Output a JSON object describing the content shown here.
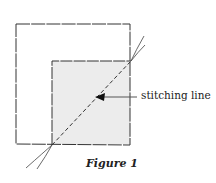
{
  "figure": {
    "caption": "Figure 1",
    "annotations": [
      {
        "label": "stitching line",
        "points_to": "diagonal-dashed-line"
      }
    ],
    "elements": [
      "outer-square",
      "inner-shaded-square",
      "diagonal-stitching-line",
      "thread-ends"
    ],
    "colors": {
      "line": "#333333",
      "shade": "#ececec"
    }
  }
}
